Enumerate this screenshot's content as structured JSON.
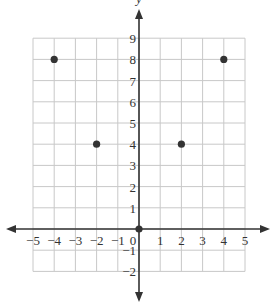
{
  "chart_data": {
    "type": "scatter",
    "title": "",
    "xlabel": "",
    "ylabel": "y",
    "xlim": [
      -5,
      5
    ],
    "ylim": [
      -2,
      9
    ],
    "grid": true,
    "x_ticks": [
      -5,
      -4,
      -3,
      -2,
      -1,
      0,
      1,
      2,
      3,
      4,
      5
    ],
    "y_ticks": [
      -2,
      -1,
      1,
      2,
      3,
      4,
      5,
      6,
      7,
      8,
      9
    ],
    "x_tick_labels": [
      "−5",
      "−4",
      "−3",
      "−2",
      "−1",
      "0",
      "1",
      "2",
      "3",
      "4",
      "5"
    ],
    "y_tick_labels": [
      "−2",
      "−1",
      "1",
      "2",
      "3",
      "4",
      "5",
      "6",
      "7",
      "8",
      "9"
    ],
    "points": [
      {
        "x": -4,
        "y": 8
      },
      {
        "x": -2,
        "y": 4
      },
      {
        "x": 0,
        "y": 0
      },
      {
        "x": 2,
        "y": 4
      },
      {
        "x": 4,
        "y": 8
      }
    ],
    "colors": {
      "grid": "#c8c8c8",
      "axis": "#333333",
      "point": "#333333"
    }
  }
}
